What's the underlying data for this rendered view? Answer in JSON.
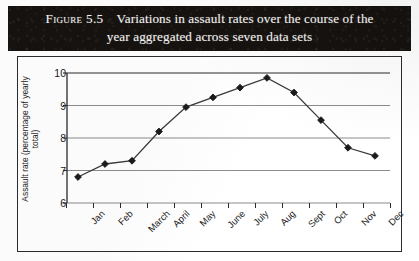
{
  "caption": {
    "figure_number": "Figure 5.5",
    "line1": "Variations in assault rates over the course of the",
    "line2": "year aggregated across seven data sets",
    "band_color": "#15120f",
    "text_color": "#f3f1ee"
  },
  "chart_data": {
    "type": "line",
    "title": "Variations in assault rates over the course of the year aggregated across seven data sets",
    "xlabel": "",
    "ylabel": "Assault rate (percentage of yearly total)",
    "categories": [
      "Jan",
      "Feb",
      "March",
      "April",
      "May",
      "June",
      "July",
      "Aug",
      "Sept",
      "Oct",
      "Nov",
      "Dec"
    ],
    "values": [
      6.8,
      7.2,
      7.3,
      8.2,
      8.95,
      9.25,
      9.55,
      9.85,
      9.4,
      8.55,
      7.7,
      7.45
    ],
    "series": [
      {
        "name": "Assault rate",
        "values": [
          6.8,
          7.2,
          7.3,
          8.2,
          8.95,
          9.25,
          9.55,
          9.85,
          9.4,
          8.55,
          7.7,
          7.45
        ]
      }
    ],
    "ylim": [
      6,
      10
    ],
    "yticks": [
      6,
      7,
      8,
      9,
      10
    ],
    "ytick_labels": [
      "6",
      "7",
      "8",
      "9",
      "10"
    ],
    "grid": "horizontal",
    "legend": "none",
    "marker": "diamond",
    "marker_color": "#1b1b1b",
    "line_color": "#3a3a3a",
    "axis_color": "#2b2b2b",
    "gridline_color": "#8c8c8c",
    "xtick_label_rotation": "-45"
  }
}
